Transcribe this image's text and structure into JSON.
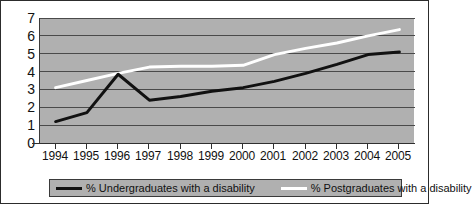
{
  "chart_data": {
    "type": "line",
    "title": "",
    "xlabel": "",
    "ylabel": "",
    "categories": [
      "1994",
      "1995",
      "1996",
      "1997",
      "1998",
      "1999",
      "2000",
      "2001",
      "2002",
      "2003",
      "2004",
      "2005"
    ],
    "ylim": [
      0,
      7
    ],
    "yticks": [
      "0",
      "1",
      "2",
      "3",
      "4",
      "5",
      "6",
      "7"
    ],
    "grid": true,
    "legend_position": "bottom",
    "series": [
      {
        "name": "% Undergraduates with a disability",
        "color": "#111111",
        "values": [
          1.2,
          1.7,
          3.85,
          2.4,
          2.6,
          2.9,
          3.1,
          3.45,
          3.9,
          4.4,
          4.95,
          5.1
        ]
      },
      {
        "name": "% Postgraduates with a disability",
        "color": "#ffffff",
        "values": [
          3.1,
          3.5,
          3.9,
          4.25,
          4.3,
          4.3,
          4.35,
          4.95,
          5.3,
          5.6,
          6.0,
          6.35
        ]
      }
    ]
  },
  "legend": {
    "undergrad_label": "% Undergraduates with a disability",
    "postgrad_label": "% Postgraduates with a disability"
  },
  "colors": {
    "plot_background": "#b0b0b0",
    "gridline": "#4a4a4a",
    "axis": "#2f2f2f",
    "undergrad_line": "#111111",
    "postgrad_line": "#ffffff",
    "page_background": "#ffffff",
    "border": "#2c2c2c"
  }
}
